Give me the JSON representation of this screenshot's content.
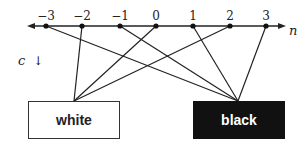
{
  "diagram": {
    "axis_label": "n",
    "side_label": "c",
    "arrow_glyph": "↓",
    "points": [
      {
        "label": "−3",
        "x": 46,
        "target": "black"
      },
      {
        "label": "−2",
        "x": 82,
        "target": "white"
      },
      {
        "label": "−1",
        "x": 120,
        "target": "black"
      },
      {
        "label": "0",
        "x": 156,
        "target": "white"
      },
      {
        "label": "1",
        "x": 193,
        "target": "black"
      },
      {
        "label": "2",
        "x": 230,
        "target": "white"
      },
      {
        "label": "3",
        "x": 266,
        "target": "black"
      }
    ],
    "boxes": {
      "white": {
        "label": "white",
        "anchor_x": 74,
        "anchor_y": 101
      },
      "black": {
        "label": "black",
        "anchor_x": 238,
        "anchor_y": 101
      }
    }
  }
}
